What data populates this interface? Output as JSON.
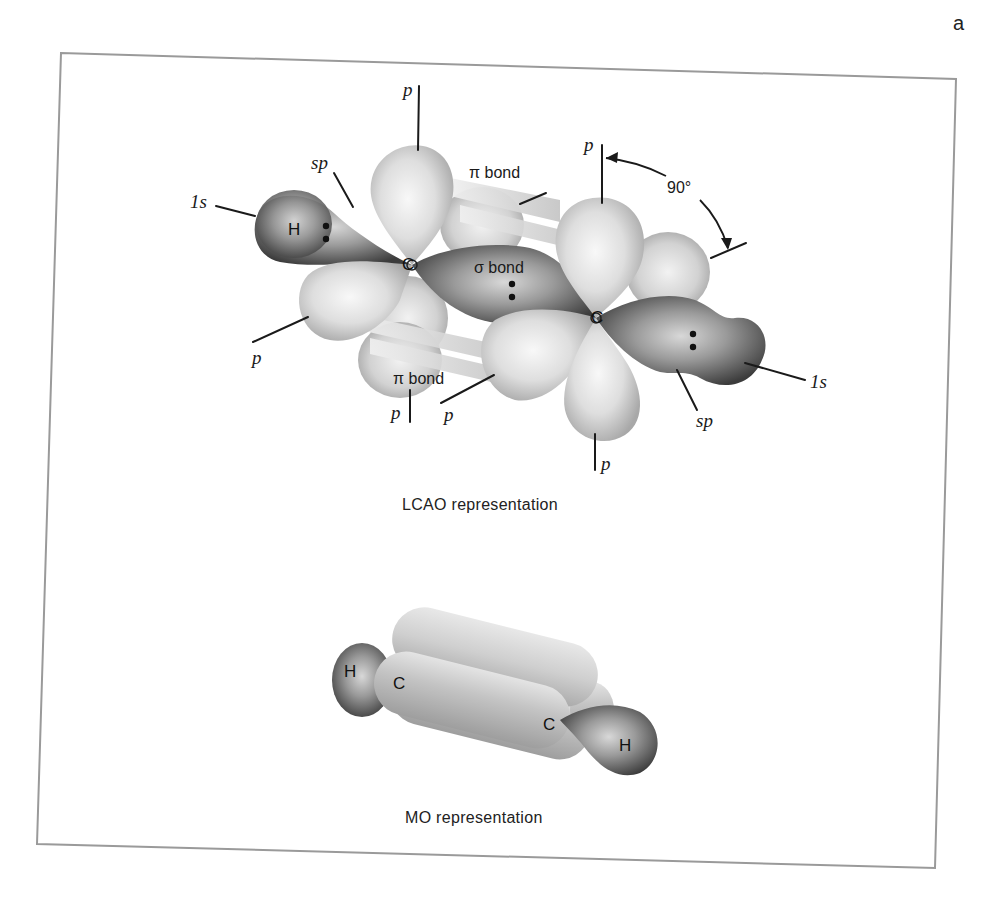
{
  "page": {
    "corner_letter": "a",
    "frame_color": "#9a9a9a"
  },
  "lcao": {
    "caption": "LCAO representation",
    "labels": {
      "p_top_left": "p",
      "sp_left": "sp",
      "one_s_left": "1s",
      "h_left": "H",
      "c_left": "C",
      "pi_bond_top": "π bond",
      "sigma_bond": "σ bond",
      "p_top_right": "p",
      "angle": "90°",
      "c_right": "C",
      "one_s_right": "1s",
      "sp_right": "sp",
      "p_left_lower": "p",
      "pi_bond_bottom": "π bond",
      "p_bottom_mid": "p",
      "p_bottom_mid2": "p",
      "p_bottom_right": "p"
    },
    "colors": {
      "light_lobe": "#d6d6d6",
      "light_lobe_highlight": "#f4f4f4",
      "dark_lobe": "#5a5a5a",
      "dark_lobe_highlight": "#c8c8c8",
      "line": "#1a1a1a"
    }
  },
  "mo": {
    "caption": "MO representation",
    "labels": {
      "h_left": "H",
      "c_left": "C",
      "c_right": "C",
      "h_right": "H"
    }
  }
}
